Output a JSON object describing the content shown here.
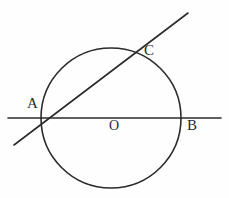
{
  "figure": {
    "kind": "circle-geometry-diagram",
    "width": 229,
    "height": 198,
    "background_color": "#fefefe",
    "stroke_color": "#2b2b2b",
    "label_color": "#2b2b2b"
  },
  "labels": {
    "a": "A",
    "b": "B",
    "c": "C",
    "o": "O"
  },
  "chart_data": {
    "type": "diagram",
    "title": "",
    "xlabel": "",
    "ylabel": "",
    "circle": {
      "name": "circle-O",
      "center_label": "O",
      "cx": 111,
      "cy": 118,
      "r": 70,
      "stroke": "#2b2b2b",
      "stroke_width": 1.6,
      "fill": "none"
    },
    "lines": [
      {
        "name": "secant-AB",
        "description": "horizontal secant through center passing A, O, B",
        "x1": 8,
        "y1": 118,
        "x2": 221,
        "y2": 118,
        "stroke": "#2b2b2b",
        "stroke_width": 1.6
      },
      {
        "name": "secant-AC",
        "description": "oblique secant through A and C",
        "x1": 14,
        "y1": 145,
        "x2": 188,
        "y2": 13,
        "stroke": "#2b2b2b",
        "stroke_width": 1.6
      }
    ],
    "points": [
      {
        "name": "A",
        "label": "A",
        "x": 41,
        "y": 118,
        "note": "left intersection of both secants with circle"
      },
      {
        "name": "O",
        "label": "O",
        "x": 111,
        "y": 118,
        "note": "center of circle"
      },
      {
        "name": "B",
        "label": "B",
        "x": 181,
        "y": 118,
        "note": "right intersection of horizontal secant with circle"
      },
      {
        "name": "C",
        "label": "C",
        "x": 133,
        "y": 56,
        "note": "upper intersection of oblique secant with circle"
      }
    ],
    "label_positions": [
      {
        "label": "A",
        "x": 27,
        "y": 96
      },
      {
        "label": "B",
        "x": 187,
        "y": 118
      },
      {
        "label": "C",
        "x": 144,
        "y": 43
      },
      {
        "label": "O",
        "x": 109,
        "y": 119
      }
    ]
  }
}
